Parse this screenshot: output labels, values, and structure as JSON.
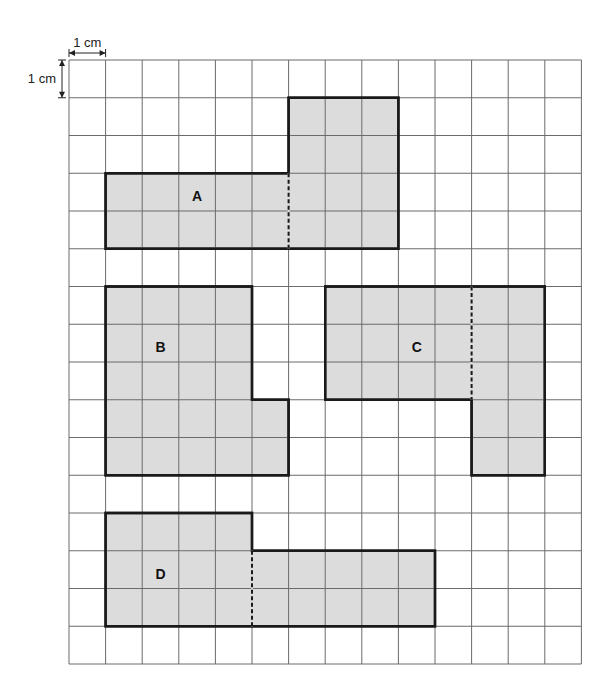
{
  "grid": {
    "columns": 14,
    "rows": 16,
    "origin_x": 69,
    "origin_y": 60,
    "cell_w": 36.6,
    "cell_h": 37.75,
    "line_color": "#6b6b6b",
    "fill_color": "#dcdcdc",
    "outline_color": "#1a1a1a"
  },
  "scale": {
    "horizontal_label": "1 cm",
    "vertical_label": "1 cm"
  },
  "shapes": [
    {
      "id": "A",
      "label": "A",
      "outline": [
        [
          1,
          3
        ],
        [
          6,
          3
        ],
        [
          6,
          1
        ],
        [
          9,
          1
        ],
        [
          9,
          5
        ],
        [
          1,
          5
        ]
      ],
      "dashed": [
        [
          6,
          3
        ],
        [
          6,
          5
        ]
      ],
      "label_pos": [
        3.5,
        3.65
      ]
    },
    {
      "id": "B",
      "label": "B",
      "outline": [
        [
          1,
          6
        ],
        [
          5,
          6
        ],
        [
          5,
          9
        ],
        [
          6,
          9
        ],
        [
          6,
          11
        ],
        [
          1,
          11
        ]
      ],
      "dashed": null,
      "label_pos": [
        2.5,
        7.65
      ]
    },
    {
      "id": "C",
      "label": "C",
      "outline": [
        [
          7,
          6
        ],
        [
          13,
          6
        ],
        [
          13,
          11
        ],
        [
          11,
          11
        ],
        [
          11,
          9
        ],
        [
          7,
          9
        ]
      ],
      "dashed": [
        [
          11,
          6
        ],
        [
          11,
          9
        ]
      ],
      "label_pos": [
        9.5,
        7.65
      ]
    },
    {
      "id": "D",
      "label": "D",
      "outline": [
        [
          1,
          12
        ],
        [
          5,
          12
        ],
        [
          5,
          13
        ],
        [
          10,
          13
        ],
        [
          10,
          15
        ],
        [
          1,
          15
        ]
      ],
      "dashed": [
        [
          5,
          13
        ],
        [
          5,
          15
        ]
      ],
      "label_pos": [
        2.5,
        13.65
      ]
    }
  ]
}
